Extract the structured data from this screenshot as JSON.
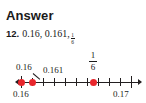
{
  "heading": {
    "title": "Answer"
  },
  "problem": {
    "number": "12.",
    "values_text": "0.16, 0.161,",
    "fraction": {
      "numerator": "1",
      "denominator": "6"
    }
  },
  "number_line": {
    "axis": {
      "min": 0.16,
      "max": 0.17,
      "tick_count": 11
    },
    "end_labels": {
      "left": "0.16",
      "right": "0.17"
    },
    "point_labels": {
      "p1": "0.16",
      "p2": "0.161",
      "p3_numerator": "1",
      "p3_denominator": "6"
    },
    "points": [
      {
        "label": "0.16",
        "value": 0.16
      },
      {
        "label": "0.161",
        "value": 0.161
      },
      {
        "label": "1/6",
        "value": 0.1667
      }
    ],
    "colors": {
      "point": "#e8262c",
      "axis": "#231f20",
      "text": "#1a1a1a"
    }
  }
}
